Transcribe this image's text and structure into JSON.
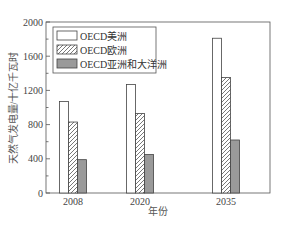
{
  "chart_data": {
    "type": "bar",
    "title": "",
    "xlabel": "年份",
    "ylabel": "天然气发电量/十亿千瓦时",
    "ylim": [
      0,
      2000
    ],
    "yticks": [
      0,
      400,
      800,
      1200,
      1600,
      2000
    ],
    "categories": [
      "2008",
      "2020",
      "2035"
    ],
    "series": [
      {
        "name": "OECD美洲",
        "pattern": "white",
        "values": [
          1070,
          1270,
          1810
        ]
      },
      {
        "name": "OECD欧洲",
        "pattern": "hatched",
        "values": [
          830,
          930,
          1350
        ]
      },
      {
        "name": "OECD亚洲和大洋洲",
        "pattern": "gray",
        "values": [
          390,
          450,
          620
        ]
      }
    ],
    "legend_position": "upper left",
    "grid": false
  },
  "colors": {
    "axis": "#555555",
    "bar_outline": "#444444",
    "white_fill": "#ffffff",
    "gray_fill": "#9a9a9a",
    "hatch": "#555555"
  }
}
